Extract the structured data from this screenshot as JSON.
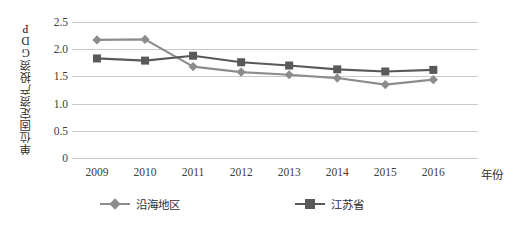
{
  "chart_data": {
    "type": "line",
    "title": "",
    "xlabel": "年份",
    "ylabel": "单位固定资产投资GDP",
    "x": [
      "2009",
      "2010",
      "2011",
      "2012",
      "2013",
      "2014",
      "2015",
      "2016"
    ],
    "categories": [
      "2009",
      "2010",
      "2011",
      "2012",
      "2013",
      "2014",
      "2015",
      "2016"
    ],
    "yticks": [
      "0",
      "0.5",
      "1.0",
      "1.5",
      "2.0",
      "2.5"
    ],
    "ytick_values": [
      0,
      0.5,
      1.0,
      1.5,
      2.0,
      2.5
    ],
    "ylim": [
      0,
      2.5
    ],
    "grid": true,
    "legend_position": "bottom",
    "series": [
      {
        "name": "沿海地区",
        "marker": "diamond",
        "color": "#8c8c8c",
        "values": [
          2.17,
          2.18,
          1.68,
          1.58,
          1.53,
          1.47,
          1.35,
          1.44
        ]
      },
      {
        "name": "江苏省",
        "marker": "square",
        "color": "#595959",
        "values": [
          1.83,
          1.79,
          1.88,
          1.76,
          1.7,
          1.63,
          1.59,
          1.62
        ]
      }
    ]
  },
  "axes": {
    "y_title": "单位固定资产投资GDP",
    "x_title": "年份"
  },
  "legend": {
    "items": [
      {
        "label": "沿海地区",
        "marker": "diamond-marker",
        "color": "#8c8c8c"
      },
      {
        "label": "江苏省",
        "marker": "square-marker",
        "color": "#595959"
      }
    ]
  },
  "colors": {
    "grid": "#c9c9c9",
    "text": "#3c3c3c",
    "series_coastal": "#8c8c8c",
    "series_jiangsu": "#595959",
    "background": "#ffffff"
  }
}
